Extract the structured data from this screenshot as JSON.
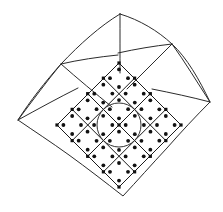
{
  "figure": {
    "kind": "diagram",
    "background_color": "#ffffff",
    "line_color": "#1a1a1a",
    "node_color": "#111111",
    "circle_color": "#333333",
    "canvas": {
      "width": 223,
      "height": 212
    }
  },
  "chart_data": {
    "type": "diagram",
    "counts": {
      "outer_cells": 8,
      "inner_cells": 16,
      "gauss_points_per_cell": 4,
      "total_gauss_points": 64,
      "circles": 1
    },
    "extreme_points": {
      "apex_top": [
        120,
        14
      ],
      "corner_left": [
        18,
        120
      ],
      "corner_right": [
        210,
        102
      ],
      "corner_bottom": [
        123,
        196
      ]
    },
    "circle": {
      "cx": 119,
      "cy": 125,
      "r": 22
    },
    "outer_boundary": "M 120 14 C 163 28 194 60 210 102 C 180 138 150 168 123 196 C 90 170 55 145 18 120 C 47 80 82 42 120 14 Z",
    "outer_grid_lines": [
      "M 59 52 C 90 74 116 96 142 121",
      "M 173 63 C 146 90 119 117 92 146",
      "M 33 86 C 66 108 95 131 122 156",
      "M 191 79 C 164 104 136 130 110 158",
      "M 88 29 C 113 47 140 67 166 89",
      "M 151 24 C 128 46 105 70 82 93"
    ],
    "inner_block": {
      "rows": 4,
      "cols": 4,
      "center": [
        119,
        125
      ],
      "half_diagonal": 62
    },
    "markers": {
      "node_marker_shape": "square",
      "node_marker_size": 3.2,
      "gauss_point_shape": "circle",
      "gauss_point_radius": 1.9
    }
  },
  "labels": {
    "none": ""
  }
}
